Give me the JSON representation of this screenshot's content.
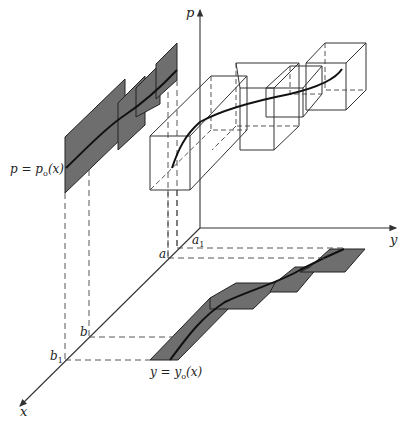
{
  "figure": {
    "type": "3D phase-space diagram",
    "axes": {
      "p_label": "p",
      "y_label": "y",
      "x_label": "x"
    },
    "x_axis_marks": {
      "a": "a",
      "a1": "a",
      "a1_sub": "1",
      "b": "b",
      "b1": "b",
      "b1_sub": "1"
    },
    "curve_labels": {
      "p_curve": "p = p",
      "p_curve_sub": "o",
      "p_curve_tail": "(x)",
      "y_curve": "y = y",
      "y_curve_sub": "o",
      "y_curve_tail": "(x)"
    },
    "colors": {
      "shaded_region": "#6e6e6e",
      "line": "#333333",
      "curve": "#111111",
      "background": "#ffffff"
    }
  }
}
